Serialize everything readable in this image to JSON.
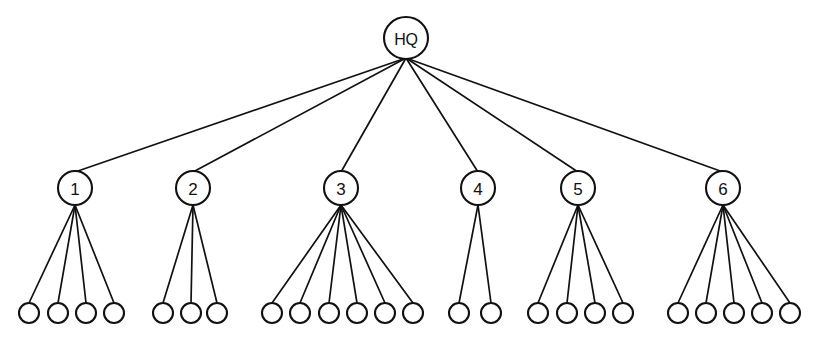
{
  "diagram": {
    "type": "tree",
    "background_color": "#ffffff",
    "line_color": "#111111",
    "node_fill_color": "#ffffff",
    "root": {
      "id": "hq",
      "label": "HQ",
      "cx": 406,
      "cy": 38,
      "rx": 22,
      "ry": 21,
      "edge_origin_x": 406,
      "edge_origin_y": 58
    },
    "branches": [
      {
        "id": "node-1",
        "label": "1",
        "cx": 75,
        "cy": 188,
        "rx": 17,
        "ry": 17,
        "edge_origin_x": 75,
        "edge_origin_y": 205,
        "leaf_count": 4,
        "leaves": [
          {
            "id": "leaf-1-1",
            "label": "",
            "cx": 29,
            "cy": 313
          },
          {
            "id": "leaf-1-2",
            "label": "",
            "cx": 58,
            "cy": 313
          },
          {
            "id": "leaf-1-3",
            "label": "",
            "cx": 86,
            "cy": 313
          },
          {
            "id": "leaf-1-4",
            "label": "",
            "cx": 114,
            "cy": 313
          }
        ]
      },
      {
        "id": "node-2",
        "label": "2",
        "cx": 193,
        "cy": 188,
        "rx": 17,
        "ry": 17,
        "edge_origin_x": 193,
        "edge_origin_y": 205,
        "leaf_count": 3,
        "leaves": [
          {
            "id": "leaf-2-1",
            "label": "",
            "cx": 163,
            "cy": 313
          },
          {
            "id": "leaf-2-2",
            "label": "",
            "cx": 191,
            "cy": 313
          },
          {
            "id": "leaf-2-3",
            "label": "",
            "cx": 217,
            "cy": 313
          }
        ]
      },
      {
        "id": "node-3",
        "label": "3",
        "cx": 341,
        "cy": 188,
        "rx": 17,
        "ry": 17,
        "edge_origin_x": 341,
        "edge_origin_y": 205,
        "leaf_count": 6,
        "leaves": [
          {
            "id": "leaf-3-1",
            "label": "",
            "cx": 272,
            "cy": 313
          },
          {
            "id": "leaf-3-2",
            "label": "",
            "cx": 300,
            "cy": 313
          },
          {
            "id": "leaf-3-3",
            "label": "",
            "cx": 329,
            "cy": 313
          },
          {
            "id": "leaf-3-4",
            "label": "",
            "cx": 357,
            "cy": 313
          },
          {
            "id": "leaf-3-5",
            "label": "",
            "cx": 385,
            "cy": 313
          },
          {
            "id": "leaf-3-6",
            "label": "",
            "cx": 413,
            "cy": 313
          }
        ]
      },
      {
        "id": "node-4",
        "label": "4",
        "cx": 478,
        "cy": 188,
        "rx": 17,
        "ry": 17,
        "edge_origin_x": 478,
        "edge_origin_y": 205,
        "leaf_count": 2,
        "leaves": [
          {
            "id": "leaf-4-1",
            "label": "",
            "cx": 459,
            "cy": 313
          },
          {
            "id": "leaf-4-2",
            "label": "",
            "cx": 491,
            "cy": 313
          }
        ]
      },
      {
        "id": "node-5",
        "label": "5",
        "cx": 578,
        "cy": 188,
        "rx": 17,
        "ry": 17,
        "edge_origin_x": 578,
        "edge_origin_y": 205,
        "leaf_count": 4,
        "leaves": [
          {
            "id": "leaf-5-1",
            "label": "",
            "cx": 538,
            "cy": 313
          },
          {
            "id": "leaf-5-2",
            "label": "",
            "cx": 567,
            "cy": 313
          },
          {
            "id": "leaf-5-3",
            "label": "",
            "cx": 595,
            "cy": 313
          },
          {
            "id": "leaf-5-4",
            "label": "",
            "cx": 623,
            "cy": 313
          }
        ]
      },
      {
        "id": "node-6",
        "label": "6",
        "cx": 723,
        "cy": 188,
        "rx": 17,
        "ry": 17,
        "edge_origin_x": 723,
        "edge_origin_y": 205,
        "leaf_count": 5,
        "leaves": [
          {
            "id": "leaf-6-1",
            "label": "",
            "cx": 678,
            "cy": 313
          },
          {
            "id": "leaf-6-2",
            "label": "",
            "cx": 706,
            "cy": 313
          },
          {
            "id": "leaf-6-3",
            "label": "",
            "cx": 734,
            "cy": 313
          },
          {
            "id": "leaf-6-4",
            "label": "",
            "cx": 762,
            "cy": 313
          },
          {
            "id": "leaf-6-5",
            "label": "",
            "cx": 790,
            "cy": 313
          }
        ]
      }
    ],
    "leaf_radius": 10,
    "totals": {
      "branch_count": 6,
      "total_leaf_count": 24
    }
  }
}
